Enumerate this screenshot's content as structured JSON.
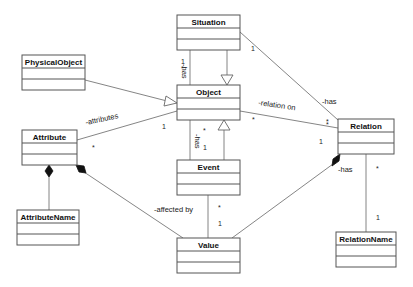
{
  "diagram": {
    "type": "UML class diagram",
    "classes": [
      {
        "id": "situation",
        "name": "Situation",
        "x": 177,
        "y": 15,
        "w": 63,
        "h": 35
      },
      {
        "id": "physicalobject",
        "name": "PhysicalObject",
        "x": 22,
        "y": 55,
        "w": 63,
        "h": 35
      },
      {
        "id": "object",
        "name": "Object",
        "x": 177,
        "y": 85,
        "w": 63,
        "h": 35
      },
      {
        "id": "attribute",
        "name": "Attribute",
        "x": 22,
        "y": 130,
        "w": 55,
        "h": 35
      },
      {
        "id": "relation",
        "name": "Relation",
        "x": 338,
        "y": 119,
        "w": 56,
        "h": 35
      },
      {
        "id": "event",
        "name": "Event",
        "x": 177,
        "y": 160,
        "w": 63,
        "h": 35
      },
      {
        "id": "attributename",
        "name": "AttributeName",
        "x": 17,
        "y": 210,
        "w": 62,
        "h": 35
      },
      {
        "id": "value",
        "name": "Value",
        "x": 177,
        "y": 238,
        "w": 63,
        "h": 35
      },
      {
        "id": "relationname",
        "name": "RelationName",
        "x": 336,
        "y": 232,
        "w": 60,
        "h": 35
      }
    ],
    "relationships": [
      {
        "from": "Situation",
        "to": "Object",
        "kind": "generalization"
      },
      {
        "from": "PhysicalObject",
        "to": "Object",
        "kind": "generalization"
      },
      {
        "from": "Event",
        "to": "Object",
        "kind": "generalization"
      },
      {
        "from": "Situation",
        "to": "Object",
        "kind": "association",
        "label": "-has",
        "mult_from": "1",
        "mult_to": "*"
      },
      {
        "from": "Situation",
        "to": "Relation",
        "kind": "association",
        "label": "-has",
        "mult_from": "1",
        "mult_to": "*"
      },
      {
        "from": "Object",
        "to": "Relation",
        "kind": "association",
        "label": "-relation on",
        "mult_from": "*",
        "mult_to": "*"
      },
      {
        "from": "Object",
        "to": "Attribute",
        "kind": "association",
        "label": "-attributes",
        "mult_from": "1",
        "mult_to": "*"
      },
      {
        "from": "Object",
        "to": "Event",
        "kind": "association",
        "label": "-has",
        "mult_from": "*",
        "mult_to": "1"
      },
      {
        "from": "Attribute",
        "to": "AttributeName",
        "kind": "composition"
      },
      {
        "from": "Attribute",
        "to": "Value",
        "kind": "composition",
        "label": "-affected by"
      },
      {
        "from": "Event",
        "to": "Value",
        "kind": "association",
        "mult_from": "*",
        "mult_to": "1"
      },
      {
        "from": "Relation",
        "to": "Value",
        "kind": "composition",
        "label": "-has",
        "mult_from": "1"
      },
      {
        "from": "Relation",
        "to": "RelationName",
        "kind": "association",
        "mult_from": "*",
        "mult_to": "1"
      }
    ]
  },
  "classes": {
    "situation": "Situation",
    "physicalobject": "PhysicalObject",
    "object": "Object",
    "attribute": "Attribute",
    "relation": "Relation",
    "event": "Event",
    "attributename": "AttributeName",
    "value": "Value",
    "relationname": "RelationName"
  },
  "labels": {
    "situation_object_has": "-has",
    "situation_relation_has": "-has",
    "relation_on": "-relation on",
    "attributes": "-attributes",
    "object_event_has": "-has",
    "affected_by": "-affected by",
    "relation_value_has": "-has"
  },
  "multiplicities": {
    "sit_obj_star": "*",
    "sit_obj_one": "1",
    "sit_rel_one": "1",
    "sit_rel_star": "*",
    "relon_obj_star": "*",
    "relon_rel_star": "*",
    "attr_obj_one": "1",
    "attr_attr_star": "*",
    "obj_event_star": "*",
    "obj_event_one": "1",
    "event_value_star": "*",
    "event_value_one": "1",
    "rel_value_one": "1",
    "rel_name_star": "*",
    "rel_name_one": "1"
  }
}
